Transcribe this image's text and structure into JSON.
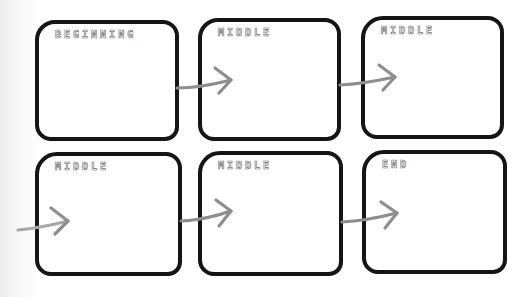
{
  "diagram": {
    "type": "story-sequence-flow",
    "rows": 2,
    "columns": 3,
    "boxes": [
      {
        "label": "BEGINNING"
      },
      {
        "label": "MIDDLE"
      },
      {
        "label": "MIDDLE"
      },
      {
        "label": "MIDDLE"
      },
      {
        "label": "MIDDLE"
      },
      {
        "label": "END"
      }
    ],
    "colors": {
      "box_border": "#151515",
      "arrow": "#8e8e8e",
      "label_outline": "#6a6a6a"
    }
  }
}
